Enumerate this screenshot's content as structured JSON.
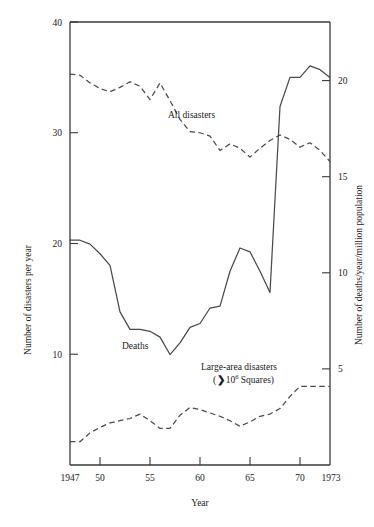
{
  "chart_data": {
    "type": "line",
    "title": "",
    "xlabel": "Year",
    "ylabel": "Number of disasters per year",
    "y2label": "Number of deaths/year/million population",
    "xlim": [
      1947,
      1973
    ],
    "ylim": [
      0,
      40
    ],
    "y2lim": [
      0,
      22.86
    ],
    "grid": false,
    "legend": "inline-annotations",
    "x_ticks": [
      1947,
      1950,
      1955,
      1960,
      1965,
      1970,
      1973
    ],
    "x_tick_labels": [
      "1947",
      "50",
      "55",
      "60",
      "65",
      "70",
      "1973"
    ],
    "y_ticks": [
      10,
      20,
      30,
      40
    ],
    "y_tick_labels": [
      "10",
      "20",
      "30",
      "40"
    ],
    "y2_ticks": [
      5,
      10,
      15,
      20
    ],
    "y2_tick_labels": [
      "5",
      "10",
      "15",
      "20"
    ],
    "series": [
      {
        "name": "All disasters",
        "style": "dashed",
        "axis": "left",
        "label_text": "All disasters",
        "x": [
          1947,
          1948,
          1949,
          1950,
          1951,
          1952,
          1953,
          1954,
          1955,
          1956,
          1957,
          1958,
          1959,
          1960,
          1961,
          1962,
          1963,
          1964,
          1965,
          1966,
          1967,
          1968,
          1969,
          1970,
          1971,
          1972,
          1973
        ],
        "values": [
          35.3,
          35.2,
          34.5,
          34.0,
          33.7,
          34.1,
          34.6,
          34.2,
          33.0,
          34.5,
          32.9,
          31.2,
          30.1,
          30.0,
          29.7,
          28.4,
          29.0,
          28.6,
          27.8,
          28.6,
          29.3,
          29.8,
          29.4,
          28.7,
          29.1,
          28.4,
          27.4
        ]
      },
      {
        "name": "Deaths",
        "style": "solid",
        "axis": "right",
        "label_text": "Deaths",
        "x": [
          1947,
          1948,
          1949,
          1950,
          1951,
          1952,
          1953,
          1954,
          1955,
          1956,
          1957,
          1958,
          1959,
          1960,
          1961,
          1962,
          1963,
          1964,
          1965,
          1966,
          1967,
          1968,
          1969,
          1970,
          1971,
          1972,
          1973
        ],
        "values": [
          11.6,
          11.6,
          11.4,
          10.9,
          10.3,
          7.9,
          7.0,
          7.0,
          6.9,
          6.6,
          5.7,
          6.3,
          7.1,
          7.3,
          8.1,
          8.2,
          10.0,
          11.2,
          11.0,
          10.0,
          8.9,
          18.5,
          20.0,
          20.0,
          20.6,
          20.4,
          20.0
        ]
      },
      {
        "name": "Large-area disasters",
        "style": "dashed",
        "axis": "left",
        "label_text": "Large-area disasters",
        "label_subtext": "( >10",
        "label_superscript": "6",
        "label_subtext_tail": " Squares)",
        "x": [
          1947,
          1948,
          1949,
          1950,
          1951,
          1952,
          1953,
          1954,
          1955,
          1956,
          1957,
          1958,
          1959,
          1960,
          1961,
          1962,
          1963,
          1964,
          1965,
          1966,
          1967,
          1968,
          1969,
          1970,
          1971,
          1972,
          1973
        ],
        "values": [
          2.1,
          2.1,
          2.9,
          3.4,
          3.8,
          4.0,
          4.2,
          4.6,
          4.0,
          3.3,
          3.3,
          4.5,
          5.2,
          5.0,
          4.7,
          4.4,
          4.0,
          3.5,
          3.9,
          4.4,
          4.6,
          5.1,
          6.2,
          7.1,
          7.1,
          7.1,
          7.1
        ]
      }
    ]
  },
  "annotations": {
    "all_disasters": "All disasters",
    "deaths": "Deaths",
    "large_area_line1": "Large-area disasters",
    "large_area_line2_pre": "(",
    "large_area_line2_gt": "❯",
    "large_area_line2_base": "10",
    "large_area_line2_sup": "6",
    "large_area_line2_post": " Squares)"
  },
  "axes": {
    "left_title": "Number of disasters per year",
    "right_title": "Number of deaths/year/million population",
    "bottom_title": "Year"
  },
  "colors": {
    "axis": "#3a3a3a",
    "curve": "#4a4a4a",
    "text": "#1a1a1a",
    "background": "#ffffff"
  }
}
